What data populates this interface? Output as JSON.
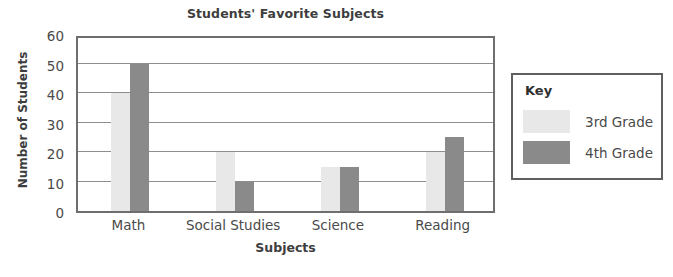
{
  "chart_data": {
    "type": "bar",
    "title": "Students' Favorite Subjects",
    "xlabel": "Subjects",
    "ylabel": "Number of Students",
    "categories": [
      "Math",
      "Social Studies",
      "Science",
      "Reading"
    ],
    "series": [
      {
        "name": "3rd Grade",
        "color": "#e8e8e8",
        "values": [
          40,
          20,
          15,
          20
        ]
      },
      {
        "name": "4th Grade",
        "color": "#8a8a8a",
        "values": [
          50,
          10,
          15,
          25
        ]
      }
    ],
    "ylim": [
      0,
      60
    ],
    "yticks": [
      0,
      10,
      20,
      30,
      40,
      50,
      60
    ],
    "ytick_labels": [
      "0",
      "10",
      "20",
      "30",
      "40",
      "50",
      "60"
    ],
    "grid": true,
    "grid_axis": "y",
    "legend_position": "right-outside"
  },
  "legend": {
    "title": "Key"
  },
  "colors": {
    "series_3rd_grade": "#e8e8e8",
    "series_4th_grade": "#8a8a8a",
    "plot_border": "#6e6e6e",
    "gridline": "#8d8d8d",
    "legend_border": "#5f5f5f",
    "text": "#4a4a4a",
    "background": "#ffffff"
  }
}
